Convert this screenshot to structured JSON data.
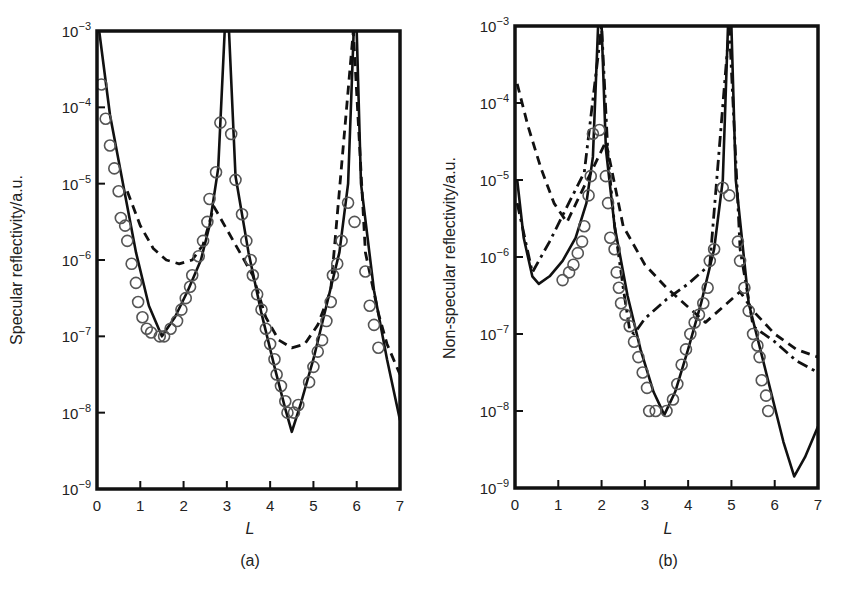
{
  "figure": {
    "panels": [
      {
        "id": "a",
        "caption": "(a)",
        "ylabel": "Specular reflectivity/a.u.",
        "xlabel": "L",
        "xticks": [
          "0",
          "1",
          "2",
          "3",
          "4",
          "5",
          "6",
          "7"
        ],
        "yticks": [
          {
            "base": "10",
            "exp": "−3"
          },
          {
            "base": "10",
            "exp": "−4"
          },
          {
            "base": "10",
            "exp": "−5"
          },
          {
            "base": "10",
            "exp": "−6"
          },
          {
            "base": "10",
            "exp": "−7"
          },
          {
            "base": "10",
            "exp": "−8"
          },
          {
            "base": "10",
            "exp": "−9"
          }
        ]
      },
      {
        "id": "b",
        "caption": "(b)",
        "ylabel": "Non-specular reflectivity/a.u.",
        "xlabel": "L",
        "xticks": [
          "0",
          "1",
          "2",
          "3",
          "4",
          "5",
          "6",
          "7"
        ],
        "yticks": [
          {
            "base": "10",
            "exp": "−3"
          },
          {
            "base": "10",
            "exp": "−4"
          },
          {
            "base": "10",
            "exp": "−5"
          },
          {
            "base": "10",
            "exp": "−6"
          },
          {
            "base": "10",
            "exp": "−7"
          },
          {
            "base": "10",
            "exp": "−8"
          },
          {
            "base": "10",
            "exp": "−9"
          }
        ]
      }
    ]
  },
  "chart_data": [
    {
      "type": "line",
      "title": "(a)",
      "xlabel": "L",
      "ylabel": "Specular reflectivity/a.u.",
      "xlim": [
        0,
        7
      ],
      "ylim": [
        1e-09,
        0.001
      ],
      "yscale": "log",
      "grid": false,
      "legend": "none",
      "series": [
        {
          "name": "solid fit",
          "style": "solid",
          "log10_points": [
            [
              0.05,
              -3.0
            ],
            [
              0.3,
              -4.1
            ],
            [
              0.6,
              -5.0
            ],
            [
              0.9,
              -5.9
            ],
            [
              1.2,
              -6.6
            ],
            [
              1.5,
              -7.0
            ],
            [
              1.8,
              -6.75
            ],
            [
              2.1,
              -6.4
            ],
            [
              2.4,
              -6.0
            ],
            [
              2.6,
              -5.55
            ],
            [
              2.8,
              -4.8
            ],
            [
              2.95,
              -3.0
            ],
            [
              3.05,
              -3.0
            ],
            [
              3.2,
              -4.9
            ],
            [
              3.5,
              -5.9
            ],
            [
              3.8,
              -6.7
            ],
            [
              4.1,
              -7.4
            ],
            [
              4.35,
              -7.95
            ],
            [
              4.5,
              -8.25
            ],
            [
              4.7,
              -7.9
            ],
            [
              5.0,
              -7.3
            ],
            [
              5.3,
              -6.6
            ],
            [
              5.6,
              -5.9
            ],
            [
              5.8,
              -5.0
            ],
            [
              5.93,
              -3.0
            ],
            [
              6.0,
              -3.0
            ],
            [
              6.1,
              -5.0
            ],
            [
              6.4,
              -6.4
            ],
            [
              6.7,
              -7.3
            ],
            [
              7.0,
              -8.1
            ]
          ]
        },
        {
          "name": "dashed fit",
          "style": "dashed",
          "log10_points": [
            [
              0.7,
              -5.1
            ],
            [
              1.0,
              -5.55
            ],
            [
              1.3,
              -5.85
            ],
            [
              1.6,
              -6.0
            ],
            [
              1.9,
              -6.05
            ],
            [
              2.2,
              -6.0
            ],
            [
              2.45,
              -5.8
            ],
            [
              2.7,
              -5.3
            ],
            [
              3.6,
              -6.2
            ],
            [
              3.9,
              -6.75
            ],
            [
              4.2,
              -7.05
            ],
            [
              4.5,
              -7.15
            ],
            [
              4.8,
              -7.1
            ],
            [
              5.1,
              -6.85
            ],
            [
              5.4,
              -6.4
            ],
            [
              5.92,
              -3.0
            ],
            [
              6.2,
              -5.9
            ],
            [
              6.5,
              -6.7
            ],
            [
              6.7,
              -7.1
            ],
            [
              7.0,
              -7.5
            ]
          ]
        },
        {
          "name": "data (circles)",
          "style": "markers",
          "log10_points": [
            [
              0.1,
              -3.7
            ],
            [
              0.2,
              -4.15
            ],
            [
              0.3,
              -4.5
            ],
            [
              0.4,
              -4.8
            ],
            [
              0.5,
              -5.1
            ],
            [
              0.55,
              -5.45
            ],
            [
              0.65,
              -5.55
            ],
            [
              0.7,
              -5.75
            ],
            [
              0.8,
              -6.05
            ],
            [
              0.9,
              -6.3
            ],
            [
              0.95,
              -6.55
            ],
            [
              1.05,
              -6.75
            ],
            [
              1.15,
              -6.9
            ],
            [
              1.25,
              -6.95
            ],
            [
              1.45,
              -7.0
            ],
            [
              1.55,
              -7.0
            ],
            [
              1.7,
              -6.9
            ],
            [
              1.85,
              -6.8
            ],
            [
              1.95,
              -6.65
            ],
            [
              2.05,
              -6.5
            ],
            [
              2.15,
              -6.35
            ],
            [
              2.2,
              -6.2
            ],
            [
              2.35,
              -5.95
            ],
            [
              2.45,
              -5.75
            ],
            [
              2.55,
              -5.5
            ],
            [
              2.6,
              -5.2
            ],
            [
              2.75,
              -4.85
            ],
            [
              2.85,
              -4.2
            ],
            [
              3.1,
              -4.35
            ],
            [
              3.2,
              -4.95
            ],
            [
              3.35,
              -5.4
            ],
            [
              3.45,
              -5.75
            ],
            [
              3.55,
              -6.0
            ],
            [
              3.6,
              -6.2
            ],
            [
              3.7,
              -6.45
            ],
            [
              3.8,
              -6.65
            ],
            [
              3.9,
              -6.9
            ],
            [
              4.0,
              -7.1
            ],
            [
              4.1,
              -7.3
            ],
            [
              4.15,
              -7.5
            ],
            [
              4.25,
              -7.65
            ],
            [
              4.35,
              -7.85
            ],
            [
              4.4,
              -8.0
            ],
            [
              4.55,
              -8.0
            ],
            [
              4.65,
              -7.9
            ],
            [
              4.9,
              -7.6
            ],
            [
              5.0,
              -7.4
            ],
            [
              5.1,
              -7.2
            ],
            [
              5.2,
              -7.05
            ],
            [
              5.3,
              -6.8
            ],
            [
              5.4,
              -6.55
            ],
            [
              5.45,
              -6.2
            ],
            [
              5.55,
              -6.05
            ],
            [
              5.65,
              -5.75
            ],
            [
              5.8,
              -5.25
            ],
            [
              5.95,
              -5.5
            ],
            [
              6.2,
              -6.15
            ],
            [
              6.3,
              -6.6
            ],
            [
              6.4,
              -6.85
            ],
            [
              6.5,
              -7.15
            ]
          ]
        }
      ]
    },
    {
      "type": "line",
      "title": "(b)",
      "xlabel": "L",
      "ylabel": "Non-specular reflectivity/a.u.",
      "xlim": [
        0,
        7
      ],
      "ylim": [
        1e-09,
        0.001
      ],
      "yscale": "log",
      "grid": false,
      "legend": "none",
      "series": [
        {
          "name": "solid fit",
          "style": "solid",
          "log10_points": [
            [
              0.05,
              -5.0
            ],
            [
              0.2,
              -5.75
            ],
            [
              0.4,
              -6.25
            ],
            [
              0.55,
              -6.35
            ],
            [
              0.8,
              -6.25
            ],
            [
              1.1,
              -6.05
            ],
            [
              1.4,
              -5.75
            ],
            [
              1.65,
              -5.3
            ],
            [
              1.8,
              -4.7
            ],
            [
              1.92,
              -3.0
            ],
            [
              2.0,
              -3.0
            ],
            [
              2.1,
              -4.6
            ],
            [
              2.3,
              -5.6
            ],
            [
              2.6,
              -6.5
            ],
            [
              2.9,
              -7.2
            ],
            [
              3.2,
              -7.75
            ],
            [
              3.45,
              -8.05
            ],
            [
              3.7,
              -7.75
            ],
            [
              4.0,
              -7.2
            ],
            [
              4.3,
              -6.6
            ],
            [
              4.6,
              -5.9
            ],
            [
              4.8,
              -5.0
            ],
            [
              4.92,
              -3.0
            ],
            [
              5.0,
              -3.0
            ],
            [
              5.1,
              -5.0
            ],
            [
              5.4,
              -6.6
            ],
            [
              5.8,
              -7.5
            ],
            [
              6.2,
              -8.4
            ],
            [
              6.45,
              -8.85
            ],
            [
              6.7,
              -8.6
            ],
            [
              7.0,
              -8.2
            ]
          ]
        },
        {
          "name": "dashed fit",
          "style": "dashed",
          "log10_points": [
            [
              0.05,
              -3.75
            ],
            [
              0.3,
              -4.3
            ],
            [
              0.6,
              -4.85
            ],
            [
              0.9,
              -5.3
            ],
            [
              1.2,
              -5.55
            ],
            [
              2.1,
              -4.5
            ],
            [
              2.5,
              -5.6
            ],
            [
              3.0,
              -6.1
            ],
            [
              3.5,
              -6.4
            ],
            [
              4.0,
              -6.65
            ],
            [
              4.4,
              -6.85
            ],
            [
              5.2,
              -6.45
            ],
            [
              5.5,
              -6.7
            ],
            [
              6.0,
              -7.0
            ],
            [
              6.5,
              -7.2
            ],
            [
              7.0,
              -7.3
            ]
          ]
        },
        {
          "name": "dash-dot fit",
          "style": "dashdot",
          "log10_points": [
            [
              0.05,
              -5.3
            ],
            [
              0.4,
              -6.2
            ],
            [
              0.8,
              -5.8
            ],
            [
              1.2,
              -5.35
            ],
            [
              1.6,
              -4.9
            ],
            [
              2.0,
              -3.0
            ],
            [
              2.15,
              -4.7
            ],
            [
              2.3,
              -5.6
            ],
            [
              2.5,
              -6.4
            ],
            [
              2.65,
              -6.95
            ],
            [
              2.75,
              -7.0
            ],
            [
              3.0,
              -6.8
            ],
            [
              3.5,
              -6.55
            ],
            [
              4.0,
              -6.35
            ],
            [
              4.5,
              -6.1
            ],
            [
              4.95,
              -3.0
            ],
            [
              5.2,
              -5.9
            ],
            [
              5.5,
              -6.9
            ],
            [
              6.0,
              -7.1
            ],
            [
              6.5,
              -7.35
            ],
            [
              7.0,
              -7.5
            ]
          ]
        },
        {
          "name": "data (circles)",
          "style": "markers",
          "log10_points": [
            [
              1.1,
              -6.3
            ],
            [
              1.25,
              -6.2
            ],
            [
              1.35,
              -6.1
            ],
            [
              1.45,
              -5.95
            ],
            [
              1.55,
              -5.8
            ],
            [
              1.6,
              -5.6
            ],
            [
              1.7,
              -5.2
            ],
            [
              1.75,
              -4.95
            ],
            [
              1.8,
              -4.4
            ],
            [
              1.95,
              -4.35
            ],
            [
              2.1,
              -4.95
            ],
            [
              2.15,
              -5.3
            ],
            [
              2.2,
              -5.75
            ],
            [
              2.3,
              -5.9
            ],
            [
              2.35,
              -6.2
            ],
            [
              2.4,
              -6.4
            ],
            [
              2.45,
              -6.6
            ],
            [
              2.55,
              -6.75
            ],
            [
              2.65,
              -6.9
            ],
            [
              2.75,
              -7.1
            ],
            [
              2.85,
              -7.3
            ],
            [
              2.95,
              -7.5
            ],
            [
              3.05,
              -7.7
            ],
            [
              3.1,
              -8.0
            ],
            [
              3.25,
              -8.0
            ],
            [
              3.5,
              -8.0
            ],
            [
              3.65,
              -7.85
            ],
            [
              3.75,
              -7.65
            ],
            [
              3.85,
              -7.4
            ],
            [
              3.95,
              -7.2
            ],
            [
              4.05,
              -7.0
            ],
            [
              4.15,
              -6.85
            ],
            [
              4.25,
              -6.75
            ],
            [
              4.35,
              -6.6
            ],
            [
              4.45,
              -6.4
            ],
            [
              4.5,
              -6.05
            ],
            [
              4.6,
              -5.9
            ],
            [
              4.8,
              -5.1
            ],
            [
              4.95,
              -5.2
            ],
            [
              5.15,
              -5.8
            ],
            [
              5.2,
              -6.05
            ],
            [
              5.3,
              -6.4
            ],
            [
              5.4,
              -6.7
            ],
            [
              5.5,
              -7.0
            ],
            [
              5.6,
              -7.15
            ],
            [
              5.65,
              -7.3
            ],
            [
              5.7,
              -7.6
            ],
            [
              5.8,
              -7.8
            ],
            [
              5.85,
              -8.0
            ]
          ]
        }
      ]
    }
  ]
}
